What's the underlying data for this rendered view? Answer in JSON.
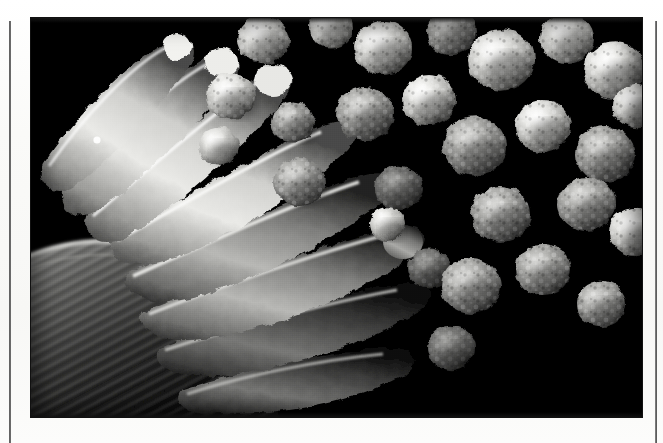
{
  "page": {
    "kind": "scanned-page",
    "background_color": "#fbfbfa",
    "width": 663,
    "height": 443,
    "caption": "",
    "header_text": "",
    "footer_text": "",
    "page_number": ""
  },
  "rules": {
    "left": {
      "name": "left-column-rule",
      "x": 9,
      "top": 21,
      "height": 422,
      "width": 2,
      "color": "#3a3a3a"
    },
    "right": {
      "name": "right-column-rule",
      "x": 655,
      "top": 21,
      "height": 422,
      "width": 2,
      "color": "#474747"
    }
  },
  "photo": {
    "title": "",
    "alt": "Scanning electron micrograph of a fungal conidiophore: elongated phialides at left radiating from a striated stalk and vesicle, with numerous rough-surfaced spherical conidia (spores) at right, on a black background.",
    "x": 31,
    "y": 18,
    "width": 611,
    "height": 399,
    "background_color": "#000000",
    "tone": "grayscale",
    "subject": "fungal conidiophore with conidia",
    "scale_bar": "",
    "magnification_label": "",
    "colors": {
      "background": "#000000",
      "highlight": "#f2f2f0",
      "bright": "#d8d8d6",
      "midtone": "#8e8e8c",
      "shadow": "#3a3a3a",
      "deep_shadow": "#121212"
    },
    "features": {
      "phialides_label": "phialides",
      "spores_label": "conidia",
      "stalk_label": "conidiophore stalk"
    }
  },
  "micrograph_data": {
    "type": "scatter",
    "description": "Approximate positions and sizes of resolved structures within the micrograph, in photo-local pixel coordinates.",
    "spores": [
      {
        "cx": 232,
        "cy": 22,
        "r": 26,
        "tone": "bright",
        "texture": "warty"
      },
      {
        "cx": 300,
        "cy": 10,
        "r": 22,
        "tone": "bright",
        "texture": "warty"
      },
      {
        "cx": 352,
        "cy": 30,
        "r": 29,
        "tone": "highlight",
        "texture": "warty"
      },
      {
        "cx": 420,
        "cy": 14,
        "r": 25,
        "tone": "mid",
        "texture": "warty"
      },
      {
        "cx": 470,
        "cy": 42,
        "r": 33,
        "tone": "highlight",
        "texture": "warty"
      },
      {
        "cx": 536,
        "cy": 20,
        "r": 27,
        "tone": "bright",
        "texture": "warty"
      },
      {
        "cx": 584,
        "cy": 52,
        "r": 31,
        "tone": "highlight",
        "texture": "warty"
      },
      {
        "cx": 200,
        "cy": 78,
        "r": 25,
        "tone": "highlight",
        "texture": "warty"
      },
      {
        "cx": 262,
        "cy": 104,
        "r": 22,
        "tone": "mid",
        "texture": "warty"
      },
      {
        "cx": 334,
        "cy": 96,
        "r": 29,
        "tone": "mid",
        "texture": "warty"
      },
      {
        "cx": 398,
        "cy": 82,
        "r": 27,
        "tone": "bright",
        "texture": "warty"
      },
      {
        "cx": 444,
        "cy": 128,
        "r": 32,
        "tone": "mid",
        "texture": "warty"
      },
      {
        "cx": 512,
        "cy": 108,
        "r": 28,
        "tone": "bright",
        "texture": "warty"
      },
      {
        "cx": 574,
        "cy": 136,
        "r": 30,
        "tone": "mid",
        "texture": "warty"
      },
      {
        "cx": 606,
        "cy": 88,
        "r": 24,
        "tone": "bright",
        "texture": "warty"
      },
      {
        "cx": 368,
        "cy": 170,
        "r": 24,
        "tone": "shadow",
        "texture": "warty"
      },
      {
        "cx": 470,
        "cy": 196,
        "r": 30,
        "tone": "mid",
        "texture": "warty"
      },
      {
        "cx": 556,
        "cy": 186,
        "r": 29,
        "tone": "mid",
        "texture": "warty"
      },
      {
        "cx": 604,
        "cy": 214,
        "r": 26,
        "tone": "bright",
        "texture": "warty"
      },
      {
        "cx": 398,
        "cy": 250,
        "r": 21,
        "tone": "shadow",
        "texture": "warty"
      },
      {
        "cx": 440,
        "cy": 268,
        "r": 30,
        "tone": "mid",
        "texture": "warty"
      },
      {
        "cx": 512,
        "cy": 252,
        "r": 28,
        "tone": "mid",
        "texture": "warty"
      },
      {
        "cx": 570,
        "cy": 286,
        "r": 25,
        "tone": "mid",
        "texture": "warty"
      },
      {
        "cx": 420,
        "cy": 330,
        "r": 24,
        "tone": "shadow",
        "texture": "warty"
      },
      {
        "cx": 356,
        "cy": 206,
        "r": 18,
        "tone": "bright",
        "texture": "smooth"
      },
      {
        "cx": 268,
        "cy": 164,
        "r": 26,
        "tone": "mid",
        "texture": "warty"
      },
      {
        "cx": 188,
        "cy": 128,
        "r": 20,
        "tone": "highlight",
        "texture": "smooth"
      }
    ],
    "phialides": [
      {
        "id": 1,
        "x1": 36,
        "y1": 118,
        "x2": 150,
        "y2": 72,
        "w": 34,
        "tone": "highlight"
      },
      {
        "id": 2,
        "x1": 44,
        "y1": 160,
        "x2": 186,
        "y2": 66,
        "w": 36,
        "tone": "highlight"
      },
      {
        "id": 3,
        "x1": 62,
        "y1": 196,
        "x2": 214,
        "y2": 52,
        "w": 34,
        "tone": "bright"
      },
      {
        "id": 4,
        "x1": 96,
        "y1": 228,
        "x2": 268,
        "y2": 116,
        "w": 38,
        "tone": "mid"
      },
      {
        "id": 5,
        "x1": 118,
        "y1": 258,
        "x2": 320,
        "y2": 162,
        "w": 40,
        "tone": "mid"
      },
      {
        "id": 6,
        "x1": 140,
        "y1": 292,
        "x2": 356,
        "y2": 214,
        "w": 40,
        "tone": "shadow"
      },
      {
        "id": 7,
        "x1": 162,
        "y1": 324,
        "x2": 380,
        "y2": 268,
        "w": 38,
        "tone": "shadow"
      },
      {
        "id": 8,
        "x1": 188,
        "y1": 356,
        "x2": 360,
        "y2": 326,
        "w": 34,
        "tone": "shadow"
      }
    ],
    "stalk": {
      "label": "conidiophore stalk",
      "x": 0,
      "y": 222,
      "width": 210,
      "height": 170,
      "texture": "longitudinal striations",
      "tone": "shadow"
    }
  }
}
